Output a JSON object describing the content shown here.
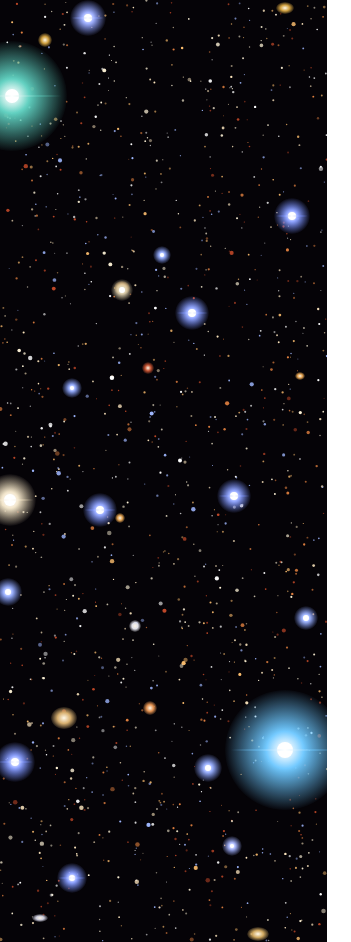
{
  "image": {
    "subject": "Deep-field astronomical image with stars and galaxies",
    "field_width": 327,
    "height": 942,
    "margin_color": "#ffffff",
    "background_color": "#050307"
  },
  "bright_stars": [
    {
      "x": 12,
      "y": 96,
      "r": 55,
      "color": "#5fd0c0",
      "core": 7,
      "label": "teal-star-top-left"
    },
    {
      "x": 88,
      "y": 18,
      "r": 18,
      "color": "#8ca0ff",
      "core": 4,
      "label": "blue-star-top"
    },
    {
      "x": 292,
      "y": 216,
      "r": 18,
      "color": "#7890ff",
      "core": 4,
      "label": "blue-star-right"
    },
    {
      "x": 192,
      "y": 313,
      "r": 17,
      "color": "#7c94ff",
      "core": 4,
      "label": "blue-star-mid"
    },
    {
      "x": 162,
      "y": 255,
      "r": 9,
      "color": "#8aa4ff",
      "core": 2,
      "label": "small-blue-star"
    },
    {
      "x": 122,
      "y": 290,
      "r": 11,
      "color": "#d8c8a0",
      "core": 3,
      "label": "white-star"
    },
    {
      "x": 72,
      "y": 388,
      "r": 10,
      "color": "#8aa4ff",
      "core": 2,
      "label": "small-blue-star-2"
    },
    {
      "x": 10,
      "y": 500,
      "r": 26,
      "color": "#f0e0c0",
      "core": 6,
      "label": "yellow-white-star-left"
    },
    {
      "x": 100,
      "y": 510,
      "r": 17,
      "color": "#7c94ff",
      "core": 4,
      "label": "blue-star-center-left"
    },
    {
      "x": 234,
      "y": 496,
      "r": 17,
      "color": "#7c94ff",
      "core": 4,
      "label": "blue-star-center-right"
    },
    {
      "x": 8,
      "y": 592,
      "r": 14,
      "color": "#8aa4ff",
      "core": 3,
      "label": "blue-star-left-edge"
    },
    {
      "x": 306,
      "y": 618,
      "r": 12,
      "color": "#8aa4ff",
      "core": 3,
      "label": "blue-star-right-edge"
    },
    {
      "x": 285,
      "y": 750,
      "r": 60,
      "color": "#6ec8ff",
      "core": 8,
      "label": "bright-blue-star-bottom-right"
    },
    {
      "x": 15,
      "y": 762,
      "r": 20,
      "color": "#7c94ff",
      "core": 4,
      "label": "blue-star-bottom-left"
    },
    {
      "x": 208,
      "y": 768,
      "r": 14,
      "color": "#8aa4ff",
      "core": 3,
      "label": "blue-star-bottom"
    },
    {
      "x": 72,
      "y": 878,
      "r": 15,
      "color": "#7c94ff",
      "core": 3,
      "label": "blue-star-very-bottom"
    },
    {
      "x": 232,
      "y": 846,
      "r": 10,
      "color": "#a0b0ff",
      "core": 2,
      "label": "small-star-bottom"
    }
  ],
  "galaxies": [
    {
      "x": 64,
      "y": 718,
      "w": 26,
      "h": 22,
      "color": "#d8b070",
      "label": "spiral-galaxy-tail"
    },
    {
      "x": 122,
      "y": 288,
      "w": 16,
      "h": 14,
      "color": "#e0a050",
      "label": "orange-galaxy"
    },
    {
      "x": 148,
      "y": 368,
      "w": 12,
      "h": 12,
      "color": "#c05030",
      "label": "red-galaxy"
    },
    {
      "x": 45,
      "y": 40,
      "w": 14,
      "h": 14,
      "color": "#d0a040",
      "label": "gold-galaxy-top"
    },
    {
      "x": 285,
      "y": 8,
      "w": 18,
      "h": 12,
      "color": "#d0a040",
      "label": "gold-galaxy-top-right"
    },
    {
      "x": 150,
      "y": 708,
      "w": 14,
      "h": 14,
      "color": "#e09050",
      "label": "orange-galaxy-lower"
    },
    {
      "x": 120,
      "y": 518,
      "w": 10,
      "h": 10,
      "color": "#e0a050",
      "label": "orange-galaxy-mid"
    },
    {
      "x": 40,
      "y": 918,
      "w": 16,
      "h": 8,
      "color": "#c8c8d8",
      "label": "edge-on-galaxy"
    },
    {
      "x": 258,
      "y": 934,
      "w": 22,
      "h": 14,
      "color": "#d0a860",
      "label": "gold-galaxy-bottom"
    },
    {
      "x": 300,
      "y": 376,
      "w": 10,
      "h": 8,
      "color": "#e0a050",
      "label": "orange-galaxy-right"
    },
    {
      "x": 135,
      "y": 626,
      "w": 12,
      "h": 12,
      "color": "#e0e0e8",
      "label": "white-galaxy"
    }
  ],
  "starfield": {
    "count": 1400,
    "seed": 42,
    "palette": [
      "#ffffff",
      "#ffe8c0",
      "#ffc070",
      "#e08040",
      "#c04828",
      "#a0b8ff",
      "#fff4d8"
    ]
  }
}
